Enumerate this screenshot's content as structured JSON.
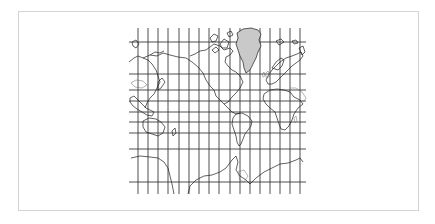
{
  "figure": {
    "type": "map",
    "projection": "Mercator",
    "highlighted_region": "Greenland",
    "colors": {
      "background": "#ffffff",
      "frame": "#d4d4d4",
      "grid": "#3a3a3a",
      "coastline": "#1e1e1e",
      "highlight_fill": "#c9c9c9"
    },
    "grid": {
      "meridian_count": 18,
      "parallel_count": 10
    }
  }
}
